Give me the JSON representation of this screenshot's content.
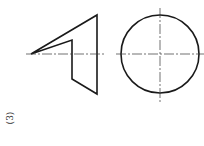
{
  "figure": {
    "label": "(3)",
    "line_color": "#1a1a1a",
    "centerline_color": "#333333",
    "front_view": {
      "outline_points": [
        [
          31,
          54
        ],
        [
          97,
          15
        ],
        [
          97,
          94
        ],
        [
          72,
          79
        ],
        [
          72,
          40
        ]
      ],
      "centerline": {
        "x1": 26,
        "y1": 54,
        "x2": 104,
        "y2": 54
      }
    },
    "side_view": {
      "circle": {
        "cx": 160,
        "cy": 54,
        "r": 39
      },
      "horizontal_centerline": {
        "x1": 116,
        "y1": 54,
        "x2": 204,
        "y2": 54
      },
      "vertical_centerline": {
        "x1": 160,
        "y1": 8,
        "x2": 160,
        "y2": 102
      }
    }
  }
}
